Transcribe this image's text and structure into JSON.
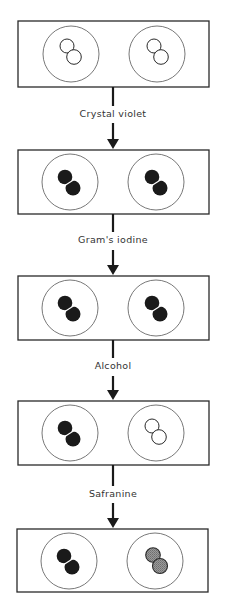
{
  "colors": {
    "outline": "#2a2a2a",
    "stained_dark": "#1a1a1a",
    "unstained": "#ffffff",
    "counterstained": "#8c8c8c",
    "background": "#ffffff"
  },
  "stages": [
    {
      "index": 0,
      "left_cells": "unstained",
      "right_cells": "unstained"
    },
    {
      "index": 1,
      "reagent": "Crystal violet",
      "left_cells": "stained_dark",
      "right_cells": "stained_dark"
    },
    {
      "index": 2,
      "reagent": "Gram's iodine",
      "left_cells": "stained_dark",
      "right_cells": "stained_dark"
    },
    {
      "index": 3,
      "reagent": "Alcohol",
      "left_cells": "stained_dark",
      "right_cells": "unstained"
    },
    {
      "index": 4,
      "reagent": "Safranine",
      "left_cells": "stained_dark",
      "right_cells": "counterstained"
    }
  ],
  "labels": {
    "step1": "Crystal violet",
    "step2": "Gram's iodine",
    "step3": "Alcohol",
    "step4": "Safranine"
  }
}
